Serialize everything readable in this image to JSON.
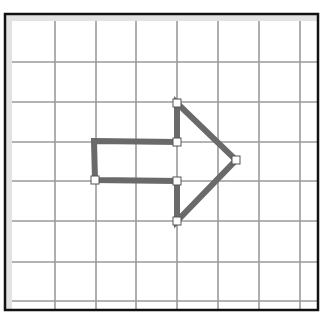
{
  "diagram": {
    "type": "grid-shape-editor",
    "frame": {
      "x": 5,
      "y": 14,
      "width": 313,
      "height": 296,
      "border_color": "#111111",
      "inner_strip_color": "#e2e2e2"
    },
    "grid": {
      "color": "#9a9a9a",
      "vertical_lines_x": [
        55,
        96,
        136,
        177,
        218,
        259,
        300
      ],
      "horizontal_lines_y": [
        62,
        102,
        142,
        181,
        221,
        262,
        301
      ]
    },
    "shape": {
      "name": "right-arrow",
      "stroke_color": "#6a6a6a",
      "stroke_width": 6,
      "points": [
        [
          94,
          141
        ],
        [
          177,
          142
        ],
        [
          177,
          103
        ],
        [
          236,
          160
        ],
        [
          177,
          221
        ],
        [
          177,
          181
        ],
        [
          95,
          180
        ]
      ],
      "handles": [
        [
          177,
          103
        ],
        [
          177,
          142
        ],
        [
          236,
          160
        ],
        [
          177,
          181
        ],
        [
          177,
          221
        ],
        [
          95,
          180
        ]
      ],
      "handle_fill": "#ffffff",
      "handle_stroke": "#555555"
    }
  }
}
